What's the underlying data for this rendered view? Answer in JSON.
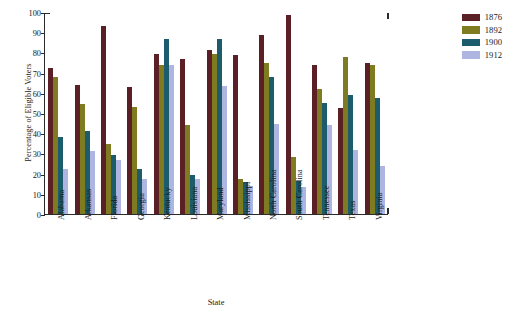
{
  "chart_data": {
    "type": "bar",
    "title": "",
    "xlabel": "State",
    "ylabel": "Percentage of Eligible Voters",
    "ylim": [
      0,
      100
    ],
    "ytick_values": [
      0,
      10,
      20,
      30,
      40,
      50,
      60,
      70,
      80,
      90,
      100
    ],
    "grid": false,
    "legend_position": "top-right",
    "categories": [
      "Alabama",
      "Arkansas",
      "Florida",
      "Georgia",
      "Kentucky",
      "Louisiana",
      "Maryland",
      "Mississippi",
      "North Carolina",
      "South Carolina",
      "Tennessee",
      "Texas",
      "Virginia"
    ],
    "series": [
      {
        "name": "1876",
        "color": "#5b1f26",
        "values": [
          72.5,
          64,
          93,
          63,
          79,
          76.5,
          81,
          78.5,
          88.5,
          98.5,
          74,
          52.5,
          75
        ]
      },
      {
        "name": "1892",
        "color": "#7e7b20",
        "values": [
          68,
          54.5,
          34.5,
          53,
          74,
          44,
          79,
          17.5,
          75,
          28,
          62,
          77.5,
          74
        ]
      },
      {
        "name": "1900",
        "color": "#1d5c6c",
        "values": [
          38,
          41,
          29,
          22.5,
          86.5,
          19.5,
          86.5,
          16,
          68,
          16.5,
          55,
          59,
          57.5
        ]
      },
      {
        "name": "1912",
        "color": "#aeb5e0",
        "values": [
          22.5,
          31,
          26.5,
          17.5,
          74,
          17.5,
          63.5,
          14,
          44.5,
          13.5,
          44,
          31.5,
          24
        ]
      }
    ]
  },
  "legend": {
    "entries": [
      {
        "label": "1876"
      },
      {
        "label": "1892"
      },
      {
        "label": "1900"
      },
      {
        "label": "1912"
      }
    ]
  }
}
